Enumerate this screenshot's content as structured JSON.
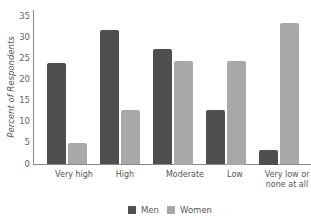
{
  "chart_data": {
    "type": "bar",
    "title": "",
    "xlabel": "",
    "ylabel": "Percent of Respondents",
    "ylim": [
      0,
      35
    ],
    "yticks": [
      0,
      5,
      10,
      15,
      20,
      25,
      30,
      35
    ],
    "grid": false,
    "legend_position": "bottom",
    "categories": [
      "Very high",
      "High",
      "Moderate",
      "Low",
      "Very low or none at all"
    ],
    "series": [
      {
        "name": "Men",
        "color": "#4f4f4f",
        "values": [
          24,
          32,
          27.5,
          13,
          3.5
        ]
      },
      {
        "name": "Women",
        "color": "#a8a8a8",
        "values": [
          5,
          13,
          24.5,
          24.5,
          33.5
        ]
      }
    ]
  },
  "labels": {
    "ylabel": "Percent of Respondents",
    "cat0": "Very high",
    "cat1": "High",
    "cat2": "Moderate",
    "cat3": "Low",
    "cat4a": "Very low or",
    "cat4b": "none at all",
    "legend_men": "Men",
    "legend_women": "Women"
  }
}
